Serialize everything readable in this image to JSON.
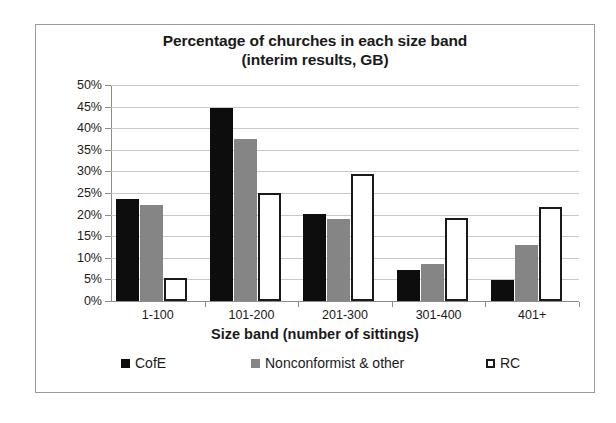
{
  "chart_data": {
    "type": "bar",
    "title": "Percentage of churches in each size band (interim results, GB)",
    "title_line1": "Percentage of churches in each size band",
    "title_line2": "(interim results, GB)",
    "xlabel": "Size band (number of sittings)",
    "ylabel": "",
    "categories": [
      "1-100",
      "101-200",
      "201-300",
      "301-400",
      "401+"
    ],
    "series": [
      {
        "name": "CofE",
        "color": "#0d0d0d",
        "values": [
          23.7,
          44.6,
          20.1,
          7.1,
          4.8
        ]
      },
      {
        "name": "Nonconformist & other",
        "color": "#858585",
        "values": [
          22.3,
          37.6,
          18.9,
          8.6,
          13.0
        ]
      },
      {
        "name": "RC",
        "color": "#ffffff",
        "values": [
          5.3,
          24.9,
          29.4,
          19.2,
          21.7
        ]
      }
    ],
    "ylim": [
      0,
      50
    ],
    "y_ticks": [
      "0%",
      "5%",
      "10%",
      "15%",
      "20%",
      "25%",
      "30%",
      "35%",
      "40%",
      "45%",
      "50%"
    ],
    "y_tick_values": [
      0,
      5,
      10,
      15,
      20,
      25,
      30,
      35,
      40,
      45,
      50
    ],
    "grid": true,
    "legend_position": "bottom",
    "legend_entries": [
      "CofE",
      "Nonconformist & other",
      "RC"
    ]
  }
}
